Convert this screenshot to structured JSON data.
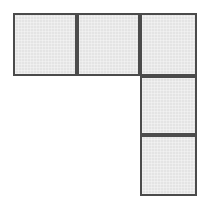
{
  "figure": {
    "shape_name": "l-pentomino",
    "cell_count": 5,
    "background_color": "#ffffff",
    "fill_color": "#e9e9e9",
    "border_color": "#4b4b4b",
    "border_width_px": 2,
    "canvas": {
      "width": 205,
      "height": 202
    },
    "grid": {
      "columns": 3,
      "rows": 3,
      "x_edges": [
        13,
        77,
        140,
        197
      ],
      "y_edges": [
        13,
        76,
        135,
        196
      ]
    },
    "cells": [
      {
        "label": "cell-top-left",
        "row": 0,
        "col": 0,
        "x": 13,
        "y": 13,
        "width": 64,
        "height": 63
      },
      {
        "label": "cell-top-middle",
        "row": 0,
        "col": 1,
        "x": 77,
        "y": 13,
        "width": 63,
        "height": 63
      },
      {
        "label": "cell-top-right",
        "row": 0,
        "col": 2,
        "x": 140,
        "y": 13,
        "width": 57,
        "height": 63
      },
      {
        "label": "cell-middle-right",
        "row": 1,
        "col": 2,
        "x": 140,
        "y": 76,
        "width": 57,
        "height": 59
      },
      {
        "label": "cell-bottom-right",
        "row": 2,
        "col": 2,
        "x": 140,
        "y": 135,
        "width": 57,
        "height": 61
      }
    ]
  }
}
